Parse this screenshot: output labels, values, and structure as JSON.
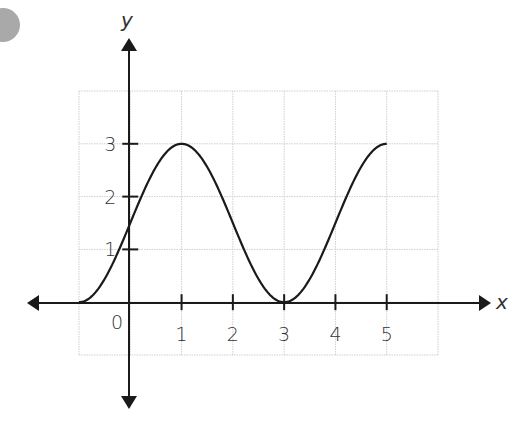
{
  "chart_data": {
    "type": "line",
    "title": "",
    "xlabel": "x",
    "ylabel": "y",
    "xlim": [
      -1,
      6
    ],
    "ylim": [
      -1,
      4
    ],
    "grid": true,
    "x_ticks": [
      1,
      2,
      3,
      4,
      5
    ],
    "y_ticks": [
      1,
      2,
      3
    ],
    "origin_label": "0",
    "series": [
      {
        "name": "curve",
        "description": "smooth sinusoidal curve y = 1.5 - 1.5cos(pi*(x+1)/2) from x=-1 to x=5",
        "x": [
          -1,
          -0.5,
          0,
          0.5,
          1,
          1.5,
          2,
          2.5,
          3,
          3.5,
          4,
          4.5,
          5
        ],
        "y": [
          0,
          0.44,
          1.5,
          2.56,
          3,
          2.56,
          1.5,
          0.44,
          0,
          0.44,
          1.5,
          2.56,
          3
        ]
      }
    ],
    "legend": null
  },
  "labels": {
    "x_axis": "x",
    "y_axis": "y",
    "origin": "0",
    "x_ticks": [
      "1",
      "2",
      "3",
      "4",
      "5"
    ],
    "y_ticks": [
      "1",
      "2",
      "3"
    ]
  },
  "colors": {
    "grid": "#cfcfcf",
    "axis": "#1a1a1a",
    "curve": "#1a1a1a",
    "badge": "#a9a9a9"
  }
}
